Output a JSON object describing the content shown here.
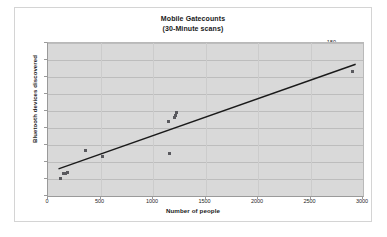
{
  "chart_data": {
    "type": "scatter",
    "title": "Mobile Gatecounts",
    "subtitle": "(30-Minute scans)",
    "xlabel": "Number of people",
    "ylabel": "Bluetooth devices discovered",
    "xlim": [
      0,
      3000
    ],
    "ylim": [
      0,
      180
    ],
    "xticks": [
      0,
      500,
      1000,
      1500,
      2000,
      2500,
      3000
    ],
    "yticks": [
      0,
      20,
      40,
      60,
      80,
      100,
      120,
      140,
      160,
      180
    ],
    "grid": "horizontal",
    "legend": "none",
    "marker_color": "#59595e",
    "trendline_color": "#1a1a1a",
    "plot_background": "#d9d9d9",
    "points": [
      {
        "x": 120,
        "y": 21
      },
      {
        "x": 150,
        "y": 26
      },
      {
        "x": 168,
        "y": 27
      },
      {
        "x": 182,
        "y": 28
      },
      {
        "x": 360,
        "y": 53
      },
      {
        "x": 520,
        "y": 47
      },
      {
        "x": 1150,
        "y": 88
      },
      {
        "x": 1160,
        "y": 50
      },
      {
        "x": 1200,
        "y": 92
      },
      {
        "x": 1218,
        "y": 95
      },
      {
        "x": 1228,
        "y": 98
      },
      {
        "x": 2900,
        "y": 147
      }
    ],
    "trendline": {
      "x0": 100,
      "y0": 32,
      "x1": 2930,
      "y1": 155
    }
  }
}
